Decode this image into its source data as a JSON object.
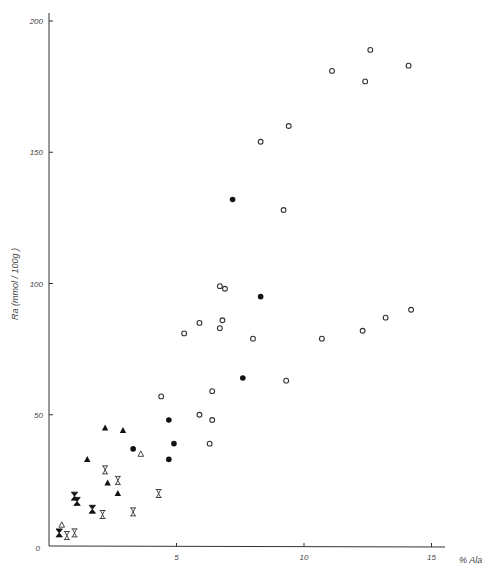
{
  "chart_data": {
    "type": "scatter",
    "title": "",
    "xlabel": "% Ala",
    "ylabel": "Ra (mmol / 100g )",
    "xlim": [
      0,
      15.5
    ],
    "ylim": [
      0,
      200
    ],
    "grid": false,
    "legend": null,
    "x_ticks": [
      {
        "value": 0,
        "label": "0"
      },
      {
        "value": 5,
        "label": "5"
      },
      {
        "value": 10,
        "label": "10"
      },
      {
        "value": 15,
        "label": "15"
      }
    ],
    "y_ticks": [
      {
        "value": 50,
        "label": "50"
      },
      {
        "value": 100,
        "label": "100"
      },
      {
        "value": 150,
        "label": "150"
      },
      {
        "value": 200,
        "label": "200"
      }
    ],
    "series": [
      {
        "name": "open-circle",
        "marker": "circle-open",
        "points": [
          [
            12.6,
            189
          ],
          [
            14.1,
            183
          ],
          [
            11.1,
            181
          ],
          [
            12.4,
            177
          ],
          [
            9.4,
            160
          ],
          [
            8.3,
            154
          ],
          [
            9.2,
            128
          ],
          [
            6.7,
            99
          ],
          [
            6.9,
            98
          ],
          [
            5.9,
            85
          ],
          [
            6.8,
            86
          ],
          [
            6.7,
            83
          ],
          [
            5.3,
            81
          ],
          [
            8.0,
            79
          ],
          [
            10.7,
            79
          ],
          [
            12.3,
            82
          ],
          [
            13.2,
            87
          ],
          [
            14.2,
            90
          ],
          [
            9.3,
            63
          ],
          [
            4.4,
            57
          ],
          [
            6.4,
            59
          ],
          [
            5.9,
            50
          ],
          [
            6.4,
            48
          ],
          [
            6.3,
            39
          ]
        ]
      },
      {
        "name": "filled-circle",
        "marker": "circle-filled",
        "points": [
          [
            7.2,
            132
          ],
          [
            8.3,
            95
          ],
          [
            7.6,
            64
          ],
          [
            4.7,
            48
          ],
          [
            4.9,
            39
          ],
          [
            4.7,
            33
          ],
          [
            3.3,
            37
          ]
        ]
      },
      {
        "name": "filled-triangle",
        "marker": "triangle-filled",
        "points": [
          [
            2.2,
            45
          ],
          [
            2.9,
            44
          ],
          [
            1.5,
            33
          ],
          [
            2.3,
            24
          ],
          [
            2.7,
            20
          ]
        ]
      },
      {
        "name": "open-triangle",
        "marker": "triangle-open",
        "points": [
          [
            3.6,
            35
          ],
          [
            0.5,
            8
          ]
        ]
      },
      {
        "name": "open-hourglass",
        "marker": "hourglass-open",
        "points": [
          [
            2.2,
            29
          ],
          [
            2.7,
            25
          ],
          [
            4.3,
            20
          ],
          [
            2.1,
            12
          ],
          [
            3.3,
            13
          ],
          [
            0.7,
            4
          ],
          [
            1.0,
            5
          ]
        ]
      },
      {
        "name": "filled-hourglass",
        "marker": "hourglass-filled",
        "points": [
          [
            1.0,
            19
          ],
          [
            1.1,
            17
          ],
          [
            1.7,
            14
          ],
          [
            0.4,
            5
          ]
        ]
      }
    ]
  },
  "axes": {
    "x_label": "% Ala",
    "y_label": "Ra (mmol / 100g )",
    "origin_label": "0"
  },
  "layout": {
    "origin_px": [
      49,
      546
    ],
    "x_px_per_unit": 25.5,
    "y_px_per_unit": 2.625,
    "x_axis_end_px": 445,
    "y_axis_top_px": 13,
    "ink_color": "#333333"
  }
}
